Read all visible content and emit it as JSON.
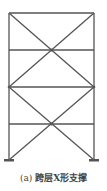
{
  "diagram": {
    "type": "frame-elevation",
    "stroke_color": "#555555",
    "columns_x": [
      9,
      94
    ],
    "beams_y": [
      13,
      50,
      87,
      124
    ],
    "base_y": 160,
    "braces": [
      {
        "from": [
          9,
          13
        ],
        "to": [
          94,
          87
        ]
      },
      {
        "from": [
          94,
          13
        ],
        "to": [
          9,
          87
        ]
      },
      {
        "from": [
          9,
          87
        ],
        "to": [
          94,
          160
        ]
      },
      {
        "from": [
          94,
          87
        ],
        "to": [
          9,
          160
        ]
      }
    ],
    "supports": [
      "fixed-left",
      "fixed-right"
    ]
  },
  "caption": {
    "label": "(a)",
    "text": "跨层X形支撑"
  }
}
